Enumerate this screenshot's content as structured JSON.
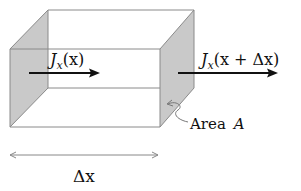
{
  "diagram": {
    "type": "flux-through-volume-element",
    "labels": {
      "flux_in": {
        "main": "J",
        "sub": "x",
        "arg": "(x)"
      },
      "flux_out": {
        "main": "J",
        "sub": "x",
        "arg": "(x + Δx)"
      },
      "area": {
        "text": "Area",
        "symbol": "A"
      },
      "length": "Δx"
    },
    "colors": {
      "edge": "#8a8a8a",
      "face_fill": "#c8c8c8",
      "arrow": "#111111",
      "text": "#111111",
      "dimension_line": "#888888"
    }
  }
}
